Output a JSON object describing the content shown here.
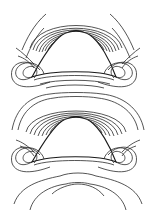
{
  "figure": {
    "type": "contour-diagram",
    "background": "#ffffff",
    "line_color": "#2a2a2a",
    "bodies": [
      {
        "name": "upper-body",
        "apex": [
          76,
          30
        ],
        "left_corner": [
          32,
          77
        ],
        "right_corner": [
          116,
          77
        ]
      },
      {
        "name": "lower-body",
        "apex": [
          76,
          116
        ],
        "left_corner": [
          32,
          162
        ],
        "right_corner": [
          116,
          162
        ]
      }
    ],
    "apex_contour_count": 14,
    "corner_swirl_count": 3,
    "text_labels": []
  }
}
